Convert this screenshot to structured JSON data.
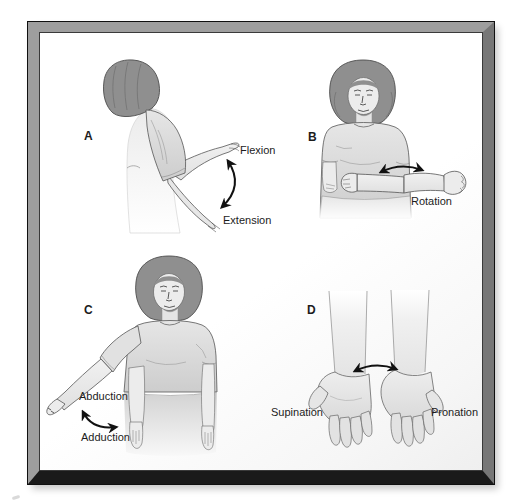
{
  "figure": {
    "panels": {
      "a": {
        "letter": "A",
        "flexion": "Flexion",
        "extension": "Extension"
      },
      "b": {
        "letter": "B",
        "rotation": "Rotation"
      },
      "c": {
        "letter": "C",
        "abduction": "Abduction",
        "adduction": "Adduction"
      },
      "d": {
        "letter": "D",
        "supination": "Supination",
        "pronation": "Pronation"
      }
    }
  },
  "colors": {
    "frame_light": "#9e9e9e",
    "frame_mid": "#777777",
    "frame_dark": "#1a1a1a",
    "background": "#ffffff",
    "hair": "#8f8f8f",
    "skin": "#ececec",
    "shirt": "#dcdcdc",
    "outline": "#555555",
    "arrow": "#111111",
    "text": "#1c1c1c"
  }
}
